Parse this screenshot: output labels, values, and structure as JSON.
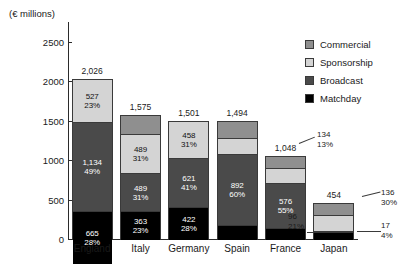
{
  "chart_data": {
    "type": "bar",
    "subtype": "stacked-vertical",
    "title": "",
    "xlabel": "",
    "ylabel": "(€ millions)",
    "ylim": [
      0,
      2750
    ],
    "yticks": [
      0,
      500,
      1000,
      1500,
      2000,
      2500
    ],
    "ytick_labels": [
      "0",
      "500",
      "1000",
      "1500",
      "2000",
      "2500"
    ],
    "grid": false,
    "legend_position": "top-right",
    "categories": [
      "England",
      "Italy",
      "Germany",
      "Spain",
      "France",
      "Japan"
    ],
    "totals": [
      2026,
      1575,
      1501,
      1494,
      1048,
      454
    ],
    "total_labels": [
      "2,026",
      "1,575",
      "1,501",
      "1,494",
      "1,048",
      "454"
    ],
    "series": [
      {
        "name": "Matchday",
        "color": "#000000",
        "values": [
          665,
          363,
          422,
          195,
          150,
          96
        ],
        "value_labels": [
          "665",
          "363",
          "422",
          "195",
          "150",
          "96"
        ],
        "pct_labels": [
          "28%",
          "23%",
          "28%",
          "13%",
          "14%",
          "21%"
        ]
      },
      {
        "name": "Broadcast",
        "color": "#4a4a4a",
        "values": [
          1134,
          489,
          621,
          892,
          576,
          17
        ],
        "value_labels": [
          "1,134",
          "489",
          "621",
          "892",
          "576",
          "17"
        ],
        "pct_labels": [
          "49%",
          "31%",
          "41%",
          "60%",
          "55%",
          "4%"
        ]
      },
      {
        "name": "Sponsorship",
        "color": "#d4d4d4",
        "values": [
          527,
          489,
          458,
          209,
          188,
          205
        ],
        "value_labels": [
          "527",
          "489",
          "458",
          "209",
          "188",
          "205"
        ],
        "pct_labels": [
          "23%",
          "31%",
          "31%",
          "14%",
          "18%",
          "45%"
        ]
      },
      {
        "name": "Commercial",
        "color": "#8f8f8f",
        "values": [
          0,
          234,
          0,
          198,
          134,
          136
        ],
        "value_labels": [
          "",
          "234",
          "",
          "198",
          "134",
          "136"
        ],
        "pct_labels": [
          "",
          "15%",
          "",
          "13%",
          "13%",
          "30%"
        ]
      }
    ],
    "legend": [
      {
        "label": "Commercial",
        "color": "#8f8f8f"
      },
      {
        "label": "Sponsorship",
        "color": "#d4d4d4"
      },
      {
        "label": "Broadcast",
        "color": "#4a4a4a"
      },
      {
        "label": "Matchday",
        "color": "#000000"
      }
    ],
    "callouts": [
      {
        "category": "France",
        "series": "Commercial",
        "value_label": "134",
        "pct_label": "13%"
      },
      {
        "category": "Japan",
        "series": "Matchday",
        "value_label": "96",
        "pct_label": "21%"
      },
      {
        "category": "Japan",
        "series": "Broadcast",
        "value_label": "17",
        "pct_label": "4%"
      },
      {
        "category": "Japan",
        "series": "Commercial",
        "value_label": "136",
        "pct_label": "30%"
      }
    ]
  }
}
